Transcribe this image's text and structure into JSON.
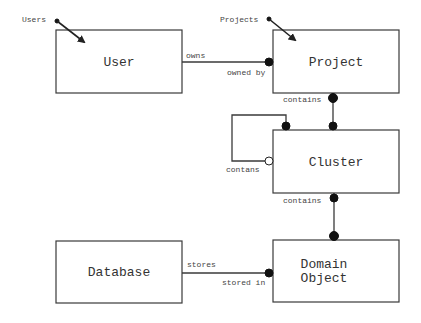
{
  "diagram": {
    "type": "entity-relationship",
    "entities": {
      "user": {
        "label": "User"
      },
      "project": {
        "label": "Project"
      },
      "cluster": {
        "label": "Cluster"
      },
      "database": {
        "label": "Database"
      },
      "domain_object": {
        "label_line1": "Domain",
        "label_line2": "Object"
      }
    },
    "pointers": {
      "users": {
        "label": "Users"
      },
      "projects": {
        "label": "Projects"
      }
    },
    "relationships": {
      "user_project": {
        "from_label": "owns",
        "to_label": "owned by"
      },
      "project_cluster": {
        "label": "contains"
      },
      "cluster_self": {
        "label": "contans"
      },
      "cluster_domain": {
        "label": "contains"
      },
      "database_domain": {
        "from_label": "stores",
        "to_label": "stored in"
      }
    },
    "colors": {
      "line": "#3a3a3a",
      "text": "#333333",
      "background": "#ffffff"
    }
  }
}
